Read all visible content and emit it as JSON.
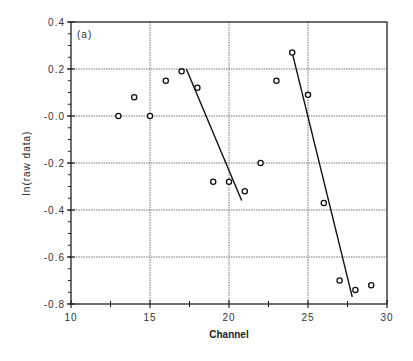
{
  "chart_data": {
    "type": "scatter",
    "title": "",
    "panel_label": "(a)",
    "xlabel": "Channel",
    "ylabel": "ln(raw   data)",
    "xlim": [
      10,
      30
    ],
    "ylim": [
      -0.8,
      0.4
    ],
    "x_ticks": [
      "10",
      "15",
      "20",
      "25",
      "30"
    ],
    "y_ticks": [
      "0.4",
      "0.2",
      "-0.0",
      "-0.2",
      "-0.4",
      "-0.6",
      "-0.8"
    ],
    "grid": true,
    "series": [
      {
        "name": "raw data",
        "marker": "open-circle",
        "x": [
          13,
          14,
          15,
          16,
          17,
          18,
          19,
          20,
          21,
          22,
          23,
          24,
          25,
          26,
          27,
          28,
          29
        ],
        "y": [
          0.0,
          0.08,
          0.0,
          0.15,
          0.19,
          0.12,
          -0.28,
          -0.28,
          -0.32,
          -0.2,
          0.15,
          0.27,
          0.09,
          -0.37,
          -0.7,
          -0.74,
          -0.72
        ]
      }
    ],
    "fit_lines": [
      {
        "name": "fit 1",
        "x": [
          17.3,
          20.8
        ],
        "y": [
          0.2,
          -0.36
        ]
      },
      {
        "name": "fit 2",
        "x": [
          24.0,
          27.8
        ],
        "y": [
          0.27,
          -0.77
        ]
      }
    ]
  }
}
